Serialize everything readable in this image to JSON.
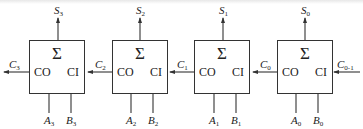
{
  "diagram": {
    "type": "4-bit ripple-carry adder (serial carry)",
    "stroke_color": "#333333",
    "adders": [
      {
        "id": "fa3",
        "symbol": "Σ",
        "carry_out_label": "CO",
        "carry_in_label": "CI",
        "sum": {
          "base": "S",
          "sub": "3"
        },
        "a": {
          "base": "A",
          "sub": "3"
        },
        "b": {
          "base": "B",
          "sub": "3"
        }
      },
      {
        "id": "fa2",
        "symbol": "Σ",
        "carry_out_label": "CO",
        "carry_in_label": "CI",
        "sum": {
          "base": "S",
          "sub": "2"
        },
        "a": {
          "base": "A",
          "sub": "2"
        },
        "b": {
          "base": "B",
          "sub": "2"
        }
      },
      {
        "id": "fa1",
        "symbol": "Σ",
        "carry_out_label": "CO",
        "carry_in_label": "CI",
        "sum": {
          "base": "S",
          "sub": "1"
        },
        "a": {
          "base": "A",
          "sub": "1"
        },
        "b": {
          "base": "B",
          "sub": "1"
        }
      },
      {
        "id": "fa0",
        "symbol": "Σ",
        "carry_out_label": "CO",
        "carry_in_label": "CI",
        "sum": {
          "base": "S",
          "sub": "0"
        },
        "a": {
          "base": "A",
          "sub": "0"
        },
        "b": {
          "base": "B",
          "sub": "0"
        }
      }
    ],
    "carries": [
      {
        "base": "C",
        "sub": "3"
      },
      {
        "base": "C",
        "sub": "2"
      },
      {
        "base": "C",
        "sub": "1"
      },
      {
        "base": "C",
        "sub": "0"
      },
      {
        "base": "C",
        "sub": "0-1"
      }
    ]
  }
}
